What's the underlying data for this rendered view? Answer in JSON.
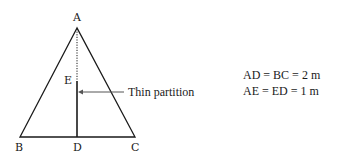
{
  "diagram": {
    "points": {
      "A": {
        "label": "A",
        "x": 77,
        "y": 28
      },
      "B": {
        "label": "B",
        "x": 20,
        "y": 137
      },
      "C": {
        "label": "C",
        "x": 135,
        "y": 137
      },
      "D": {
        "label": "D",
        "x": 77,
        "y": 137
      },
      "E": {
        "label": "E",
        "x": 77,
        "y": 81
      }
    },
    "annotation": {
      "text": "Thin partition"
    },
    "equations": [
      "AD = BC = 2 m",
      "AE = ED = 1 m"
    ],
    "colors": {
      "line": "#1a1a1a",
      "arrow": "#555555"
    }
  }
}
